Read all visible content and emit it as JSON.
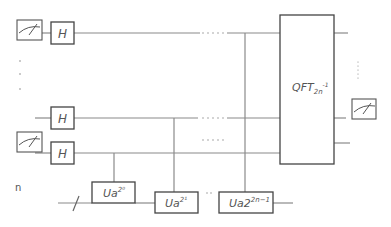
{
  "diagram": {
    "hadamard_label": "H",
    "qft": {
      "base": "QFT",
      "sub": "2n",
      "sup": "-1"
    },
    "register_label": "n",
    "gates": [
      {
        "base": "Ua",
        "sup": "2⁰"
      },
      {
        "base": "Ua",
        "sup": "2¹"
      },
      {
        "base": "Ua2",
        "sup": "2n−1"
      }
    ],
    "ellipsis_h": "....",
    "ellipsis_v": "⋮",
    "small_dots": ".."
  }
}
